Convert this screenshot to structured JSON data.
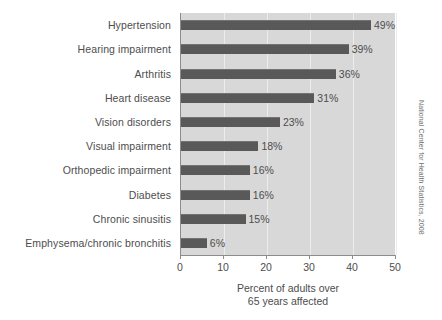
{
  "chart_data": {
    "type": "bar",
    "orientation": "horizontal",
    "title": "",
    "subtitle": "",
    "categories": [
      "Hypertension",
      "Hearing impairment",
      "Arthritis",
      "Heart disease",
      "Vision disorders",
      "Visual impairment",
      "Orthopedic impairment",
      "Diabetes",
      "Chronic sinusitis",
      "Emphysema/chronic bronchitis"
    ],
    "values": [
      49,
      39,
      36,
      31,
      23,
      18,
      16,
      16,
      15,
      6
    ],
    "data_labels": [
      "49%",
      "39%",
      "36%",
      "31%",
      "23%",
      "18%",
      "16%",
      "16%",
      "15%",
      "6%"
    ],
    "xlabel": "Percent of adults over 65 years affected",
    "xlabel_line1": "Percent of adults over",
    "xlabel_line2": "65 years affected",
    "ylabel": "",
    "xlim": [
      0,
      50
    ],
    "xticks": [
      0,
      10,
      20,
      30,
      40,
      50
    ],
    "xticklabels": [
      "0",
      "10",
      "20",
      "30",
      "40",
      "50"
    ],
    "grid": "vertical-only",
    "legend": "none",
    "annotation": "National Center for Health Statistics, 2008",
    "colors": {
      "bar": "#595959",
      "plot_background": "#d8d8d8",
      "figure_background": "#ffffff",
      "axis": "#8c8c8c",
      "text": "#4d4d4d",
      "gridline": "#ececec"
    }
  }
}
